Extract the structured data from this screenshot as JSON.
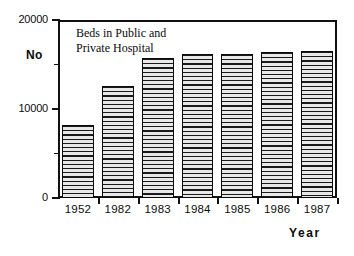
{
  "chart_data": {
    "type": "bar",
    "title": "Beds in Public and Private Hospital",
    "title_line1": "Beds in Public and",
    "title_line2": "Private Hospital",
    "xlabel": "Year",
    "ylabel": "No",
    "categories": [
      "1952",
      "1982",
      "1983",
      "1984",
      "1985",
      "1986",
      "1987"
    ],
    "values": [
      8200,
      12600,
      15700,
      16200,
      16200,
      16400,
      16500
    ],
    "ylim": [
      0,
      20000
    ],
    "ytick_values": [
      0,
      10000,
      20000
    ],
    "ytick_labels": [
      "0",
      "10000",
      "20000"
    ],
    "yminor_tick_values": [
      5000,
      15000
    ],
    "grid": false,
    "legend": false,
    "bar_fill": "horizontal-line-hatch",
    "bar_edge_color": "#0a0a0a",
    "frame_color": "#111111",
    "background": "#ffffff"
  },
  "axes": {
    "y_name": "No",
    "x_name": "Year"
  }
}
